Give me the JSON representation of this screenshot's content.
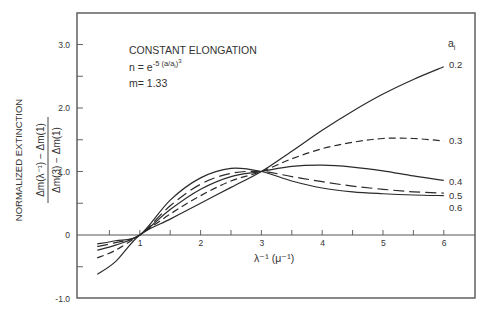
{
  "chart_data": {
    "type": "line",
    "title": "CONSTANT ELONGATION",
    "annotations": [
      "n = e^{-5(a/a_i)^3}",
      "m = 1.33"
    ],
    "annotation_lines": {
      "line1": "CONSTANT ELONGATION",
      "line2_base": "n = e",
      "line2_exp": "-5 (a/a",
      "line2_sub": "i",
      "line2_close": ")",
      "line2_cube": "3",
      "line3": "m= 1.33"
    },
    "xlabel": "λ⁻¹ (μ⁻¹)",
    "ylabel": "NORMALIZED EXTINCTION",
    "ylabel_formula_num": "Δm(λ⁻¹) − Δm(1)",
    "ylabel_formula_den": "Δm(3) − Δm(1)",
    "xlim": [
      0,
      6.5
    ],
    "ylim": [
      -1.0,
      3.5
    ],
    "x_ticks": [
      1,
      2,
      3,
      4,
      5,
      6
    ],
    "x_minor_ticks": [
      0.5,
      1.5,
      2.5,
      3.5,
      4.5,
      5.5
    ],
    "y_tick_labels": [
      "3.0",
      "2.0",
      "1.0",
      "0",
      "-1.0"
    ],
    "y_ticks": [
      3.0,
      2.0,
      1.0,
      0,
      -1.0
    ],
    "legend_title": "a_i",
    "legend_title_base": "a",
    "legend_title_sub": "i",
    "grid": false,
    "series": [
      {
        "name": "0.2",
        "style": "solid",
        "x": [
          0.3,
          0.6,
          1.0,
          1.5,
          2.0,
          2.5,
          3.0,
          3.5,
          4.0,
          4.5,
          5.0,
          5.5,
          6.0
        ],
        "y": [
          -0.62,
          -0.42,
          0.0,
          0.25,
          0.5,
          0.75,
          1.0,
          1.32,
          1.65,
          1.95,
          2.22,
          2.45,
          2.65
        ]
      },
      {
        "name": "0.3",
        "style": "dashed",
        "x": [
          0.3,
          0.6,
          1.0,
          1.5,
          2.0,
          2.5,
          3.0,
          3.5,
          4.0,
          4.5,
          5.0,
          5.5,
          6.0
        ],
        "y": [
          -0.36,
          -0.24,
          0.0,
          0.33,
          0.62,
          0.85,
          1.0,
          1.2,
          1.36,
          1.46,
          1.52,
          1.52,
          1.48
        ]
      },
      {
        "name": "0.4",
        "style": "solid",
        "x": [
          0.3,
          0.6,
          1.0,
          1.5,
          2.0,
          2.5,
          3.0,
          3.5,
          4.0,
          4.5,
          5.0,
          5.5,
          6.0
        ],
        "y": [
          -0.24,
          -0.16,
          0.0,
          0.4,
          0.72,
          0.92,
          1.0,
          1.08,
          1.1,
          1.07,
          1.01,
          0.93,
          0.86
        ]
      },
      {
        "name": "0.5",
        "style": "long-dash",
        "x": [
          0.3,
          0.6,
          1.0,
          1.5,
          2.0,
          2.5,
          3.0,
          3.5,
          4.0,
          4.5,
          5.0,
          5.5,
          6.0
        ],
        "y": [
          -0.18,
          -0.12,
          0.0,
          0.46,
          0.8,
          0.97,
          1.0,
          0.92,
          0.84,
          0.77,
          0.72,
          0.68,
          0.66
        ]
      },
      {
        "name": "0.6",
        "style": "solid",
        "x": [
          0.3,
          0.6,
          1.0,
          1.5,
          2.0,
          2.5,
          3.0,
          3.5,
          4.0,
          4.5,
          5.0,
          5.5,
          6.0
        ],
        "y": [
          -0.14,
          -0.09,
          0.0,
          0.55,
          0.9,
          1.05,
          1.0,
          0.85,
          0.74,
          0.68,
          0.65,
          0.63,
          0.62
        ]
      }
    ]
  }
}
